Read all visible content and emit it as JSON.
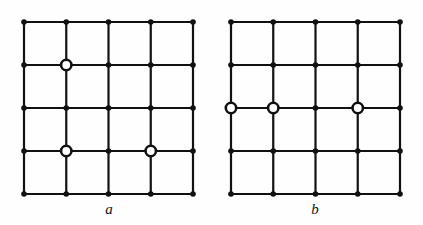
{
  "figure": {
    "background_color": "#fefefe",
    "stroke_color": "#111111",
    "node_fill_color": "#111111",
    "open_node_fill_color": "#ffffff",
    "line_width": 2.2,
    "solid_node_radius": 2.8,
    "open_node_outer_radius": 5.2,
    "open_node_inner_radius": 2.6
  },
  "panels": [
    {
      "id": "panel-a",
      "label": "a",
      "label_x": 109,
      "label_y": 209,
      "grid": {
        "rows": 5,
        "cols": 5,
        "x0": 24,
        "y0": 22,
        "dx": 42.25,
        "dy": 43,
        "x_positions": [
          24,
          66.25,
          108.5,
          150.75,
          193
        ],
        "y_positions": [
          22,
          65,
          108,
          151,
          194
        ]
      },
      "open_nodes": [
        {
          "col": 2,
          "row": 2
        },
        {
          "col": 2,
          "row": 4
        },
        {
          "col": 4,
          "row": 4
        }
      ]
    },
    {
      "id": "panel-b",
      "label": "b",
      "label_x": 315,
      "label_y": 209,
      "grid": {
        "rows": 5,
        "cols": 5,
        "x0": 231,
        "y0": 22,
        "dx": 42.25,
        "dy": 43,
        "x_positions": [
          231,
          273.25,
          315.5,
          357.75,
          400
        ],
        "y_positions": [
          22,
          65,
          108,
          151,
          194
        ]
      },
      "open_nodes": [
        {
          "col": 1,
          "row": 3
        },
        {
          "col": 2,
          "row": 3
        },
        {
          "col": 4,
          "row": 3
        }
      ]
    }
  ],
  "chart_data": {
    "type": "diagram",
    "title": "",
    "panels": [
      {
        "label": "a",
        "lattice": "5x5 square grid",
        "marked_sites": [
          [
            2,
            2
          ],
          [
            2,
            4
          ],
          [
            4,
            4
          ]
        ]
      },
      {
        "label": "b",
        "lattice": "5x5 square grid",
        "marked_sites": [
          [
            1,
            3
          ],
          [
            2,
            3
          ],
          [
            4,
            3
          ]
        ]
      }
    ]
  }
}
